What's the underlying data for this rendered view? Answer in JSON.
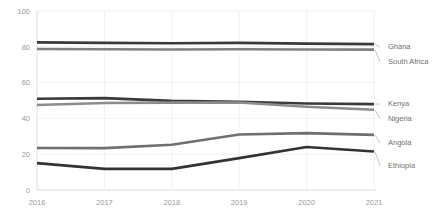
{
  "chart_data": {
    "type": "line",
    "title": "",
    "subtitle": "",
    "xlabel": "",
    "ylabel": "",
    "categories": [
      "2016",
      "2017",
      "2018",
      "2019",
      "2020",
      "2021"
    ],
    "x": [
      2016,
      2017,
      2018,
      2019,
      2020,
      2021
    ],
    "xlim": [
      2016,
      2021
    ],
    "ylim": [
      0,
      100
    ],
    "yticks": [
      0,
      20,
      40,
      60,
      80,
      100
    ],
    "xticks": [
      "2016",
      "2017",
      "2018",
      "2019",
      "2020",
      "2021"
    ],
    "grid": "horizontal-and-vertical",
    "legend_position": "right-end-labels",
    "series": [
      {
        "name": "Ghana",
        "values": [
          82.5,
          82.2,
          82.0,
          82.2,
          81.8,
          81.5
        ],
        "color": "#3a3a3a"
      },
      {
        "name": "South Africa",
        "values": [
          78.8,
          78.6,
          78.5,
          78.6,
          78.5,
          78.4
        ],
        "color": "#808080"
      },
      {
        "name": "Kenya",
        "values": [
          51.0,
          51.3,
          49.8,
          49.3,
          48.3,
          48.0
        ],
        "color": "#3a3a3a"
      },
      {
        "name": "Nigeria",
        "values": [
          47.5,
          48.6,
          48.8,
          48.9,
          46.5,
          44.8
        ],
        "color": "#8c8c8c"
      },
      {
        "name": "Angola",
        "values": [
          23.5,
          23.4,
          25.3,
          31.0,
          31.8,
          30.8
        ],
        "color": "#6f6f6f"
      },
      {
        "name": "Ethiopia",
        "values": [
          15.0,
          11.8,
          11.8,
          17.8,
          24.0,
          21.5
        ],
        "color": "#333333"
      }
    ]
  },
  "axes": {
    "y_tick_labels": [
      "100",
      "80",
      "60",
      "40",
      "20",
      "0"
    ],
    "x_tick_labels": [
      "2016",
      "2017",
      "2018",
      "2019",
      "2020",
      "2021"
    ]
  },
  "legend": {
    "items": [
      {
        "label": "Ghana"
      },
      {
        "label": "South Africa"
      },
      {
        "label": "Kenya"
      },
      {
        "label": "Nigeria"
      },
      {
        "label": "Angola"
      },
      {
        "label": "Ethiopia"
      }
    ]
  },
  "colors": {
    "grid": "#ededed",
    "axis": "#d9d9d9",
    "tick_text": "#9a9a9a",
    "legend_text": "#6f6f6f",
    "background": "#ffffff"
  }
}
